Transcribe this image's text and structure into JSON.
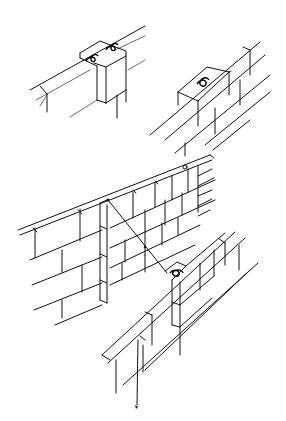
{
  "figure": {
    "stroke_color": "#111111",
    "background": "#ffffff"
  },
  "parts": [
    {
      "name": "top-left-corner-block",
      "ties": 2
    },
    {
      "name": "top-right-wall-block",
      "ties": 1
    },
    {
      "name": "long-wall",
      "ties": 0
    },
    {
      "name": "lower-wall-block",
      "ties": 1
    },
    {
      "name": "mason-line",
      "ties": 0
    }
  ]
}
